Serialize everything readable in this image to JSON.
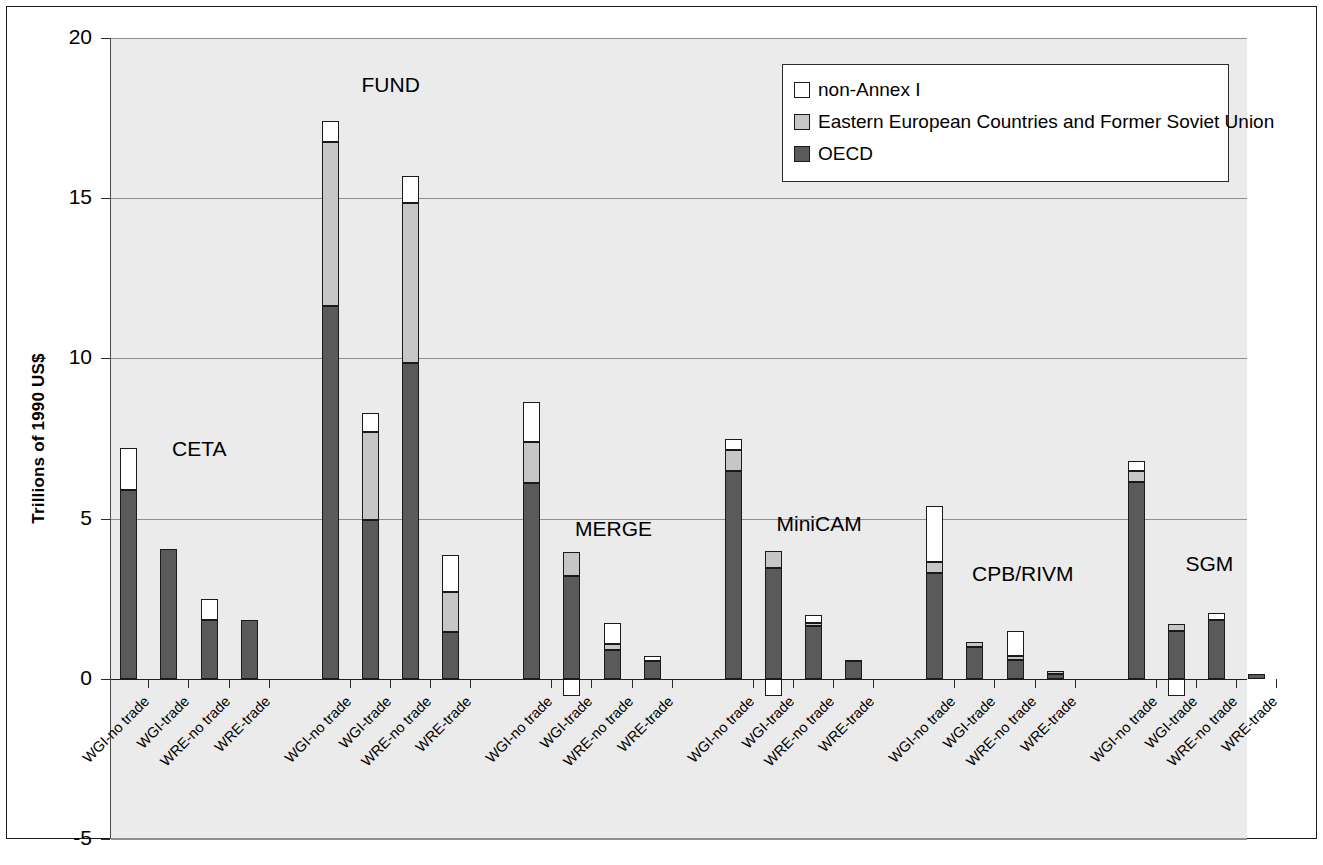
{
  "chart_data": {
    "type": "bar",
    "subtype": "stacked-bar-grouped",
    "title": "",
    "xlabel": "",
    "ylabel": "Trillions of 1990 US$",
    "ylim": [
      -5,
      20
    ],
    "yticks": [
      -5,
      0,
      5,
      10,
      15,
      20
    ],
    "ytick_labels": [
      "-5",
      "0",
      "5",
      "10",
      "15",
      "20"
    ],
    "grid": "horizontal",
    "legend_position": "top-right",
    "legend": [
      {
        "label": "non-Annex I",
        "color": "#ffffff"
      },
      {
        "label": "Eastern European Countries and Former Soviet Union",
        "color": "#c6c6c6"
      },
      {
        "label": "OECD",
        "color": "#5a5a5a"
      }
    ],
    "series_names": [
      "OECD",
      "Eastern European Countries and Former Soviet Union",
      "non-Annex I"
    ],
    "categories": [
      "WGI-no trade",
      "WGI-trade",
      "WRE-no trade",
      "WRE-trade"
    ],
    "groups": [
      {
        "name": "CETA",
        "bars": [
          {
            "category": "WGI-no trade",
            "OECD": 5.9,
            "EECFSU": 0.0,
            "nonAnnexI": 1.3,
            "total": 7.2
          },
          {
            "category": "WGI-trade",
            "OECD": 4.05,
            "EECFSU": 0.0,
            "nonAnnexI": 0.0,
            "total": 4.05
          },
          {
            "category": "WRE-no trade",
            "OECD": 1.85,
            "EECFSU": 0.0,
            "nonAnnexI": 0.65,
            "total": 2.5
          },
          {
            "category": "WRE-trade",
            "OECD": 1.85,
            "EECFSU": 0.0,
            "nonAnnexI": 0.0,
            "total": 1.85
          }
        ]
      },
      {
        "name": "FUND",
        "bars": [
          {
            "category": "WGI-no trade",
            "OECD": 11.65,
            "EECFSU": 5.1,
            "nonAnnexI": 0.65,
            "total": 17.4
          },
          {
            "category": "WGI-trade",
            "OECD": 4.95,
            "EECFSU": 2.75,
            "nonAnnexI": 0.6,
            "total": 8.3
          },
          {
            "category": "WRE-no trade",
            "OECD": 9.85,
            "EECFSU": 5.0,
            "nonAnnexI": 0.85,
            "total": 15.7
          },
          {
            "category": "WRE-trade",
            "OECD": 1.45,
            "EECFSU": 1.25,
            "nonAnnexI": 1.15,
            "total": 3.85
          }
        ]
      },
      {
        "name": "MERGE",
        "bars": [
          {
            "category": "WGI-no trade",
            "OECD": 6.1,
            "EECFSU": 1.3,
            "nonAnnexI": 1.25,
            "total": 8.65
          },
          {
            "category": "WGI-trade",
            "OECD": 3.2,
            "EECFSU": 0.75,
            "nonAnnexI": -0.55,
            "total": 3.95
          },
          {
            "category": "WRE-no trade",
            "OECD": 0.9,
            "EECFSU": 0.2,
            "nonAnnexI": 0.65,
            "total": 1.75
          },
          {
            "category": "WRE-trade",
            "OECD": 0.55,
            "EECFSU": 0.0,
            "nonAnnexI": 0.15,
            "total": 0.7
          }
        ]
      },
      {
        "name": "MiniCAM",
        "bars": [
          {
            "category": "WGI-no trade",
            "OECD": 6.5,
            "EECFSU": 0.65,
            "nonAnnexI": 0.35,
            "total": 7.5
          },
          {
            "category": "WGI-trade",
            "OECD": 3.45,
            "EECFSU": 0.55,
            "nonAnnexI": -0.55,
            "total": 4.0
          },
          {
            "category": "WRE-no trade",
            "OECD": 1.65,
            "EECFSU": 0.1,
            "nonAnnexI": 0.25,
            "total": 2.0
          },
          {
            "category": "WRE-trade",
            "OECD": 0.55,
            "EECFSU": 0.05,
            "nonAnnexI": 0.0,
            "total": 0.6
          }
        ]
      },
      {
        "name": "CPB/RIVM",
        "bars": [
          {
            "category": "WGI-no trade",
            "OECD": 3.3,
            "EECFSU": 0.35,
            "nonAnnexI": 1.75,
            "total": 5.4
          },
          {
            "category": "WGI-trade",
            "OECD": 1.0,
            "EECFSU": 0.15,
            "nonAnnexI": 0.0,
            "total": 1.15
          },
          {
            "category": "WRE-no trade",
            "OECD": 0.6,
            "EECFSU": 0.1,
            "nonAnnexI": 0.8,
            "total": 1.5
          },
          {
            "category": "WRE-trade",
            "OECD": 0.15,
            "EECFSU": 0.1,
            "nonAnnexI": 0.0,
            "total": 0.25
          }
        ]
      },
      {
        "name": "SGM",
        "bars": [
          {
            "category": "WGI-no trade",
            "OECD": 6.15,
            "EECFSU": 0.35,
            "nonAnnexI": 0.3,
            "total": 6.8
          },
          {
            "category": "WGI-trade",
            "OECD": 1.5,
            "EECFSU": 0.2,
            "nonAnnexI": -0.55,
            "total": 1.7
          },
          {
            "category": "WRE-no trade",
            "OECD": 1.85,
            "EECFSU": 0.0,
            "nonAnnexI": 0.2,
            "total": 2.05
          },
          {
            "category": "WRE-trade",
            "OECD": 0.15,
            "EECFSU": 0.0,
            "nonAnnexI": 0.0,
            "total": 0.15
          }
        ]
      }
    ]
  }
}
